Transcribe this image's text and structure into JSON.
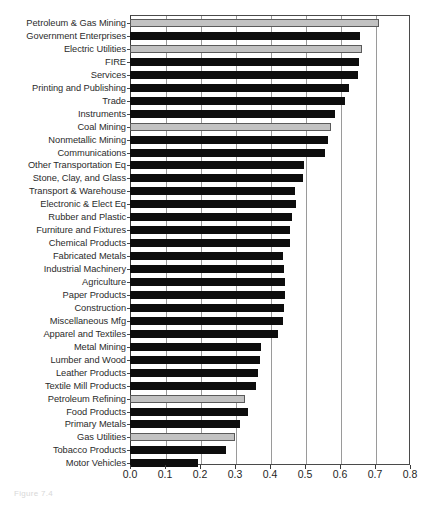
{
  "chart_data": {
    "type": "bar",
    "orientation": "horizontal",
    "title": "",
    "xlabel": "",
    "ylabel": "",
    "xlim": [
      0.0,
      0.8
    ],
    "xticks": [
      "0.0",
      "0.1",
      "0.2",
      "0.3",
      "0.4",
      "0.5",
      "0.6",
      "0.7",
      "0.8"
    ],
    "xtick_values": [
      0.0,
      0.1,
      0.2,
      0.3,
      0.4,
      0.5,
      0.6,
      0.7,
      0.8
    ],
    "grid": "vertical",
    "legend": "none",
    "series_colors": {
      "highlight": "#c2c2c2",
      "standard": "#0d0d0d"
    },
    "categories": [
      "Petroleum & Gas Mining",
      "Government Enterprises",
      "Electric Utilities",
      "FIRE",
      "Services",
      "Printing and Publishing",
      "Trade",
      "Instruments",
      "Coal Mining",
      "Nonmetallic Mining",
      "Communications",
      "Other Transportation Eq",
      "Stone, Clay, and Glass",
      "Transport & Warehouse",
      "Electronic & Elect Eq",
      "Rubber and Plastic",
      "Furniture and Fixtures",
      "Chemical Products",
      "Fabricated Metals",
      "Industrial Machinery",
      "Agriculture",
      "Paper Products",
      "Construction",
      "Miscellaneous Mfg",
      "Apparel and Textiles",
      "Metal Mining",
      "Lumber and Wood",
      "Leather Products",
      "Textile Mill Products",
      "Petroleum Refining",
      "Food Products",
      "Primary Metals",
      "Gas Utilities",
      "Tobacco Products",
      "Motor Vehicles"
    ],
    "values": [
      0.711,
      0.657,
      0.663,
      0.654,
      0.651,
      0.626,
      0.614,
      0.586,
      0.574,
      0.566,
      0.557,
      0.497,
      0.494,
      0.471,
      0.474,
      0.463,
      0.457,
      0.457,
      0.437,
      0.44,
      0.443,
      0.443,
      0.44,
      0.437,
      0.423,
      0.374,
      0.371,
      0.366,
      0.36,
      0.329,
      0.337,
      0.314,
      0.3,
      0.274,
      0.194
    ],
    "highlighted": [
      "Petroleum & Gas Mining",
      "Electric Utilities",
      "Coal Mining",
      "Petroleum Refining",
      "Gas Utilities"
    ]
  },
  "caption": {
    "text": "Figure 7.4"
  }
}
